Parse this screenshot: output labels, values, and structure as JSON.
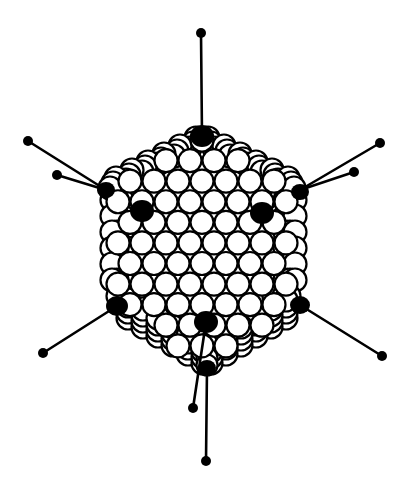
{
  "figure": {
    "colors": {
      "background": "#ffffff",
      "ink": "#000000",
      "capsomer_fill": "#ffffff"
    },
    "fibers": [
      {
        "name": "fiber-top",
        "base": [
          202,
          136
        ],
        "knob": [
          201,
          33
        ]
      },
      {
        "name": "fiber-left-outer",
        "base": [
          106,
          190
        ],
        "knob": [
          28,
          141
        ]
      },
      {
        "name": "fiber-left-inner",
        "base": [
          106,
          190
        ],
        "knob": [
          57,
          175
        ]
      },
      {
        "name": "fiber-right-outer",
        "base": [
          300,
          190
        ],
        "knob": [
          380,
          143
        ]
      },
      {
        "name": "fiber-right-inner",
        "base": [
          300,
          190
        ],
        "knob": [
          354,
          172
        ]
      },
      {
        "name": "fiber-lower-left",
        "base": [
          117,
          306
        ],
        "knob": [
          43,
          353
        ]
      },
      {
        "name": "fiber-lower-right",
        "base": [
          300,
          305
        ],
        "knob": [
          382,
          356
        ]
      },
      {
        "name": "fiber-bottom-short",
        "base": [
          206,
          322
        ],
        "knob": [
          193,
          408
        ]
      },
      {
        "name": "fiber-bottom-long",
        "base": [
          207,
          368
        ],
        "knob": [
          206,
          461
        ]
      }
    ],
    "pentons": [
      {
        "name": "penton-top",
        "c": [
          202,
          136
        ],
        "r": 11
      },
      {
        "name": "penton-left",
        "c": [
          106,
          190
        ],
        "r": 8
      },
      {
        "name": "penton-right",
        "c": [
          300,
          192
        ],
        "r": 8
      },
      {
        "name": "penton-front-left",
        "c": [
          142,
          211
        ],
        "r": 11
      },
      {
        "name": "penton-front-right",
        "c": [
          262,
          213
        ],
        "r": 11
      },
      {
        "name": "penton-lower-left",
        "c": [
          117,
          306
        ],
        "r": 10
      },
      {
        "name": "penton-lower-right",
        "c": [
          300,
          305
        ],
        "r": 9
      },
      {
        "name": "penton-bottom-front",
        "c": [
          206,
          322
        ],
        "r": 11
      },
      {
        "name": "penton-bottom",
        "c": [
          207,
          368
        ],
        "r": 8
      }
    ],
    "knob_radius": 5
  }
}
